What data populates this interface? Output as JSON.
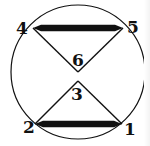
{
  "diagram": {
    "type": "circle-with-hourglass-triangles",
    "colors": {
      "stroke": "#111111",
      "background": "#ffffff"
    },
    "circle": {
      "cx": 78,
      "cy": 72,
      "r": 67
    },
    "vertices": [
      {
        "id": "1",
        "label": "1",
        "x": 122,
        "y": 124,
        "label_x": 130,
        "label_y": 135
      },
      {
        "id": "2",
        "label": "2",
        "x": 35,
        "y": 124,
        "label_x": 29,
        "label_y": 133
      },
      {
        "id": "3",
        "label": "3",
        "x": 78,
        "y": 81,
        "label_x": 77,
        "label_y": 100
      },
      {
        "id": "4",
        "label": "4",
        "x": 33,
        "y": 28,
        "label_x": 22,
        "label_y": 34
      },
      {
        "id": "5",
        "label": "5",
        "x": 123,
        "y": 28,
        "label_x": 133,
        "label_y": 33
      },
      {
        "id": "6",
        "label": "6",
        "x": 78,
        "y": 72,
        "label_x": 78,
        "label_y": 66
      }
    ],
    "thin_edges": [
      {
        "from": "4",
        "to": "6"
      },
      {
        "from": "6",
        "to": "5"
      },
      {
        "from": "2",
        "to": "3"
      },
      {
        "from": "3",
        "to": "1"
      }
    ],
    "thick_edges": [
      {
        "from": "4",
        "to": "5"
      },
      {
        "from": "2",
        "to": "1"
      }
    ]
  }
}
